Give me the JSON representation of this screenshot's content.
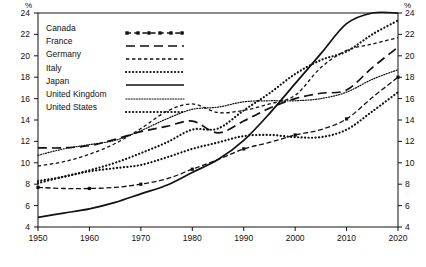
{
  "chart": {
    "type": "line",
    "unit_label_left": "%",
    "unit_label_right": "%"
  },
  "legend": {
    "position": "top-left-inside",
    "entries": [
      {
        "label": "Canada",
        "style": "dash-dot-square",
        "swatch": "canada-swatch"
      },
      {
        "label": "France",
        "style": "long-dash",
        "swatch": "france-swatch"
      },
      {
        "label": "Germany",
        "style": "short-dash",
        "swatch": "germany-swatch"
      },
      {
        "label": "Italy",
        "style": "thick-dotted",
        "swatch": "italy-swatch"
      },
      {
        "label": "Japan",
        "style": "solid",
        "swatch": "japan-swatch"
      },
      {
        "label": "United Kingdom",
        "style": "fine-dotted",
        "swatch": "uk-swatch"
      },
      {
        "label": "United States",
        "style": "thick-dotted",
        "swatch": "us-swatch"
      }
    ]
  },
  "axes": {
    "y_ticks": [
      "4",
      "6",
      "8",
      "10",
      "12",
      "14",
      "16",
      "18",
      "20",
      "22",
      "24"
    ],
    "y_ticks_right": [
      "4",
      "6",
      "8",
      "10",
      "12",
      "14",
      "16",
      "18",
      "20",
      "22",
      "24"
    ],
    "x_ticks": [
      "1950",
      "1960",
      "1970",
      "1980",
      "1990",
      "2000",
      "2010",
      "2020"
    ],
    "ylim": [
      4,
      24
    ],
    "xlim": [
      1950,
      2020
    ],
    "grid": false
  },
  "chart_data": {
    "type": "line",
    "title": "",
    "subtitle": "",
    "xlabel": "",
    "ylabel": "%",
    "xlim": [
      1950,
      2020
    ],
    "ylim": [
      4,
      24
    ],
    "grid": false,
    "legend_position": "top-left-inside",
    "x": [
      1950,
      1955,
      1960,
      1965,
      1970,
      1975,
      1980,
      1985,
      1990,
      1995,
      2000,
      2005,
      2010,
      2015,
      2020
    ],
    "series": [
      {
        "name": "Canada",
        "style": "dash-dot-square",
        "values": [
          7.7,
          7.6,
          7.6,
          7.7,
          8.0,
          8.5,
          9.4,
          10.3,
          11.3,
          11.9,
          12.6,
          13.1,
          14.1,
          16.1,
          18.0
        ]
      },
      {
        "name": "France",
        "style": "long-dash",
        "values": [
          11.4,
          11.4,
          11.6,
          12.2,
          12.9,
          13.4,
          13.9,
          12.8,
          13.9,
          15.1,
          16.0,
          16.5,
          16.8,
          18.9,
          20.8
        ]
      },
      {
        "name": "Germany",
        "style": "short-dash",
        "values": [
          9.7,
          10.1,
          10.8,
          11.8,
          13.2,
          14.8,
          15.5,
          14.7,
          14.9,
          15.5,
          16.3,
          18.9,
          20.5,
          21.1,
          21.7
        ]
      },
      {
        "name": "Italy",
        "style": "thick-dotted",
        "values": [
          8.3,
          8.7,
          9.3,
          10.0,
          10.9,
          11.9,
          13.1,
          13.2,
          14.9,
          16.5,
          18.3,
          19.6,
          20.4,
          22.0,
          23.3
        ]
      },
      {
        "name": "Japan",
        "style": "solid",
        "values": [
          4.9,
          5.3,
          5.7,
          6.3,
          7.1,
          7.9,
          9.1,
          10.3,
          12.1,
          14.6,
          17.4,
          20.2,
          23.0,
          26.6,
          28.7
        ]
      },
      {
        "name": "United Kingdom",
        "style": "fine-dotted",
        "values": [
          10.7,
          11.3,
          11.7,
          12.1,
          13.0,
          14.1,
          15.0,
          15.2,
          15.7,
          15.8,
          15.8,
          16.0,
          16.6,
          17.8,
          18.7
        ]
      },
      {
        "name": "United States",
        "style": "thick-dotted",
        "values": [
          8.1,
          8.7,
          9.2,
          9.5,
          9.8,
          10.5,
          11.3,
          11.9,
          12.5,
          12.6,
          12.4,
          12.4,
          13.1,
          14.8,
          16.6
        ]
      }
    ]
  }
}
